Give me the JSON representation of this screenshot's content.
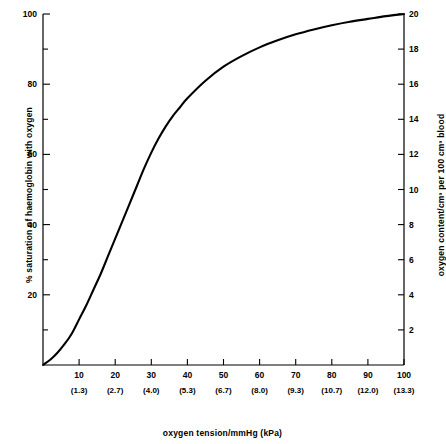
{
  "chart_data": {
    "type": "line",
    "title": "",
    "xlabel": "oxygen tension/mmHg (kPa)",
    "ylabel": "% saturation of haemoglobin with oxygen",
    "y2label": "oxygen content/cm³ per 100 cm³ blood",
    "xlim": [
      0,
      100
    ],
    "ylim": [
      0,
      100
    ],
    "y2lim": [
      0,
      20
    ],
    "grid": false,
    "legend": "none",
    "x_major_ticks": [
      10,
      20,
      30,
      40,
      50,
      60,
      70,
      80,
      90,
      100
    ],
    "x_tick_labels": [
      "10",
      "20",
      "30",
      "40",
      "50",
      "60",
      "70",
      "80",
      "90",
      "100"
    ],
    "x_tick_kpa": [
      "(1.3)",
      "(2.7)",
      "(4.0)",
      "(5.3)",
      "(6.7)",
      "(8.0)",
      "(9.3)",
      "(10.7)",
      "(12.0)",
      "(13.3)"
    ],
    "y_major_ticks": [
      20,
      40,
      60,
      80,
      100
    ],
    "y_tick_labels": [
      "20",
      "40",
      "60",
      "80",
      "100"
    ],
    "y_minor_ticks": [
      10,
      30,
      50,
      70,
      90
    ],
    "y2_major_ticks": [
      2,
      4,
      6,
      8,
      10,
      12,
      14,
      16,
      18,
      20
    ],
    "y2_tick_labels": [
      "2",
      "4",
      "6",
      "8",
      "10",
      "12",
      "14",
      "16",
      "18",
      "20"
    ],
    "series": [
      {
        "name": "oxyhaemoglobin dissociation curve",
        "color": "#000000",
        "x": [
          0,
          2,
          4,
          6,
          8,
          10,
          12,
          14,
          16,
          18,
          20,
          22,
          24,
          26,
          28,
          30,
          32,
          34,
          36,
          38,
          40,
          45,
          50,
          55,
          60,
          65,
          70,
          75,
          80,
          85,
          90,
          95,
          100
        ],
        "y": [
          0,
          1.5,
          3.5,
          6,
          9,
          13,
          17,
          21.5,
          26,
          31,
          36,
          41,
          46,
          51,
          56,
          60.5,
          64.5,
          68,
          71,
          73.5,
          76,
          81,
          85,
          88,
          90.5,
          92.5,
          94.2,
          95.6,
          96.8,
          97.8,
          98.6,
          99.4,
          100
        ]
      }
    ]
  },
  "axes": {
    "left_title": "% saturation of haemoglobin with oxygen",
    "right_title": "oxygen content/cm³ per 100 cm³ blood",
    "bottom_title": "oxygen tension/mmHg (kPa)"
  }
}
